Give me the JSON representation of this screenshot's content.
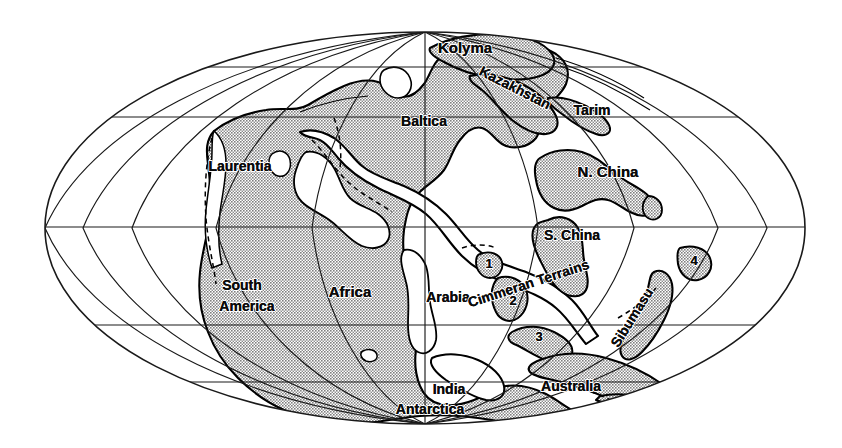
{
  "figure": {
    "type": "paleogeographic-map",
    "projection": "mollweide-elliptical",
    "title": "",
    "background_color": "#ffffff",
    "land_fill_color": "#a8a8a8",
    "shelf_fill_color": "#ffffff",
    "outline_color": "#000000",
    "graticule_color": "#1a1a1a",
    "label_color": "#0b0b0b"
  },
  "graticule": {
    "latitudes_y": [
      67,
      117,
      227,
      325,
      382
    ],
    "meridians_count": 9,
    "ellipse": {
      "cx": 425,
      "cy": 228,
      "rx": 380,
      "ry": 196
    }
  },
  "labels": [
    {
      "name": "kolyma",
      "text": "Kolyma",
      "x": 465,
      "y": 53,
      "size": 15,
      "rotate": 0
    },
    {
      "name": "kazakhstan",
      "text": "Kazakhstan",
      "x": 513,
      "y": 92,
      "size": 14,
      "rotate": 27
    },
    {
      "name": "tarim",
      "text": "Tarim",
      "x": 592,
      "y": 115,
      "size": 14,
      "rotate": 0
    },
    {
      "name": "baltica",
      "text": "Baltica",
      "x": 424,
      "y": 126,
      "size": 14,
      "rotate": 0
    },
    {
      "name": "laurentia",
      "text": "Laurentia",
      "x": 240,
      "y": 171,
      "size": 14,
      "rotate": 0
    },
    {
      "name": "n-china",
      "text": "N. China",
      "x": 608,
      "y": 177,
      "size": 15,
      "rotate": 0
    },
    {
      "name": "s-china",
      "text": "S. China",
      "x": 572,
      "y": 240,
      "size": 14,
      "rotate": 0
    },
    {
      "name": "south",
      "text": "South",
      "x": 242,
      "y": 290,
      "size": 14,
      "rotate": 0
    },
    {
      "name": "america",
      "text": "America",
      "x": 247,
      "y": 311,
      "size": 14,
      "rotate": 0
    },
    {
      "name": "africa",
      "text": "Africa",
      "x": 350,
      "y": 297,
      "size": 15,
      "rotate": 0
    },
    {
      "name": "arabia",
      "text": "Arabia",
      "x": 448,
      "y": 302,
      "size": 14,
      "rotate": 0
    },
    {
      "name": "cimmeran-terrains",
      "text": "Cimmeran Terrains",
      "x": 530,
      "y": 288,
      "size": 14,
      "rotate": -18
    },
    {
      "name": "sibumasu",
      "text": "Sibumasu",
      "x": 636,
      "y": 320,
      "size": 14,
      "rotate": -58
    },
    {
      "name": "india",
      "text": "India",
      "x": 449,
      "y": 394,
      "size": 14,
      "rotate": 0
    },
    {
      "name": "australia",
      "text": "Australia",
      "x": 571,
      "y": 391,
      "size": 14,
      "rotate": 0
    },
    {
      "name": "antarctica",
      "text": "Antarctica",
      "x": 430,
      "y": 414,
      "size": 14,
      "rotate": 0
    }
  ],
  "terrane_numbers": [
    {
      "name": "terrane-1",
      "text": "1",
      "x": 489,
      "y": 268,
      "size": 13
    },
    {
      "name": "terrane-2",
      "text": "2",
      "x": 513,
      "y": 305,
      "size": 13
    },
    {
      "name": "terrane-3",
      "text": "3",
      "x": 539,
      "y": 341,
      "size": 13
    },
    {
      "name": "terrane-4",
      "text": "4",
      "x": 694,
      "y": 265,
      "size": 13
    }
  ]
}
